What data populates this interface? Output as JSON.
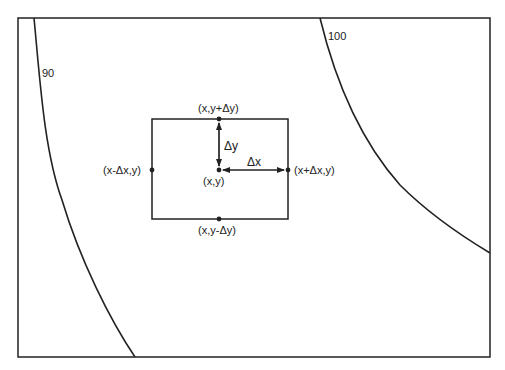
{
  "diagram": {
    "type": "finite-difference stencil on contour plot",
    "colors": {
      "line": "#222222",
      "background": "#ffffff"
    },
    "contours": [
      {
        "label": "90"
      },
      {
        "label": "100"
      }
    ],
    "points": {
      "center": "(x,y)",
      "top": "(x,y+Δy)",
      "bottom": "(x,y-Δy)",
      "left": "(x-Δx,y)",
      "right": "(x+Δx,y)"
    },
    "arrows": {
      "dy": "Δy",
      "dx": "Δx"
    }
  }
}
